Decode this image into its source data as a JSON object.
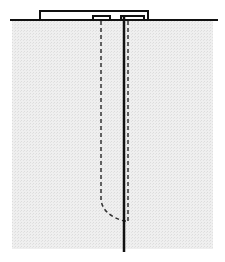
{
  "diagram": {
    "colors": {
      "background": "#ffffff",
      "region_fill": "#ececec",
      "line": "#111111"
    },
    "elements": [
      {
        "name": "surface-line",
        "type": "line"
      },
      {
        "name": "raised-plate",
        "type": "outline"
      },
      {
        "name": "left-tab",
        "type": "outline"
      },
      {
        "name": "right-tab",
        "type": "outline"
      },
      {
        "name": "gray-region",
        "type": "fill"
      },
      {
        "name": "solid-rod",
        "type": "line"
      },
      {
        "name": "dashed-hidden-path-left",
        "type": "dashed-line"
      },
      {
        "name": "dashed-hidden-path-right",
        "type": "dashed-line"
      }
    ]
  }
}
